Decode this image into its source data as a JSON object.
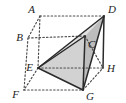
{
  "figure": {
    "width": 126,
    "height": 103,
    "background_color": "#ffffff",
    "label_color": "#1c1c1c",
    "hidden_edge_color": "#4a4a4a",
    "solid_edge_color": "#2a2a2a",
    "face_fill_light": "#e2e2e2",
    "face_fill_mid": "#d2d2d2",
    "face_fill_dark": "#bdbdbd",
    "vertices": [
      {
        "id": "A",
        "label": "A",
        "x": 40,
        "y": 16,
        "lx": 35,
        "ly": 10,
        "anchor": "end"
      },
      {
        "id": "B",
        "label": "B",
        "x": 28,
        "y": 38,
        "lx": 23,
        "ly": 38,
        "anchor": "end"
      },
      {
        "id": "C",
        "label": "C",
        "x": 85,
        "y": 36,
        "lx": 88,
        "ly": 45,
        "anchor": "start"
      },
      {
        "id": "D",
        "label": "D",
        "x": 104,
        "y": 16,
        "lx": 108,
        "ly": 10,
        "anchor": "start"
      },
      {
        "id": "E",
        "label": "E",
        "x": 38,
        "y": 68,
        "lx": 33,
        "ly": 68,
        "anchor": "end"
      },
      {
        "id": "F",
        "label": "F",
        "x": 24,
        "y": 90,
        "lx": 19,
        "ly": 95,
        "anchor": "end"
      },
      {
        "id": "G",
        "label": "G",
        "x": 83,
        "y": 90,
        "lx": 86,
        "ly": 97,
        "anchor": "start"
      },
      {
        "id": "H",
        "label": "H",
        "x": 103,
        "y": 68,
        "lx": 107,
        "ly": 69,
        "anchor": "start"
      }
    ],
    "hidden_edges": [
      {
        "name": "A-B",
        "from": "A",
        "to": "B"
      },
      {
        "name": "A-D",
        "from": "A",
        "to": "D"
      },
      {
        "name": "A-E",
        "from": "A",
        "to": "E"
      },
      {
        "name": "B-C",
        "from": "B",
        "to": "C"
      },
      {
        "name": "B-F",
        "from": "B",
        "to": "F"
      },
      {
        "name": "C-H",
        "from": "C",
        "to": "H"
      },
      {
        "name": "E-F",
        "from": "E",
        "to": "F"
      },
      {
        "name": "E-H",
        "from": "E",
        "to": "H"
      },
      {
        "name": "F-G",
        "from": "F",
        "to": "G"
      },
      {
        "name": "G-H",
        "from": "G",
        "to": "H"
      }
    ],
    "solid_edges": [
      {
        "name": "E-D",
        "from": "E",
        "to": "D"
      },
      {
        "name": "E-C",
        "from": "E",
        "to": "C"
      },
      {
        "name": "E-G",
        "from": "E",
        "to": "G"
      },
      {
        "name": "D-G",
        "from": "D",
        "to": "G"
      },
      {
        "name": "C-G",
        "from": "C",
        "to": "G"
      },
      {
        "name": "D-H",
        "from": "D",
        "to": "H"
      }
    ],
    "faces": [
      {
        "name": "face-E-C-D",
        "vertices": "E,C,D",
        "fill": "#e2e2e2"
      },
      {
        "name": "face-E-C-G",
        "vertices": "E,C,G",
        "fill": "#d2d2d2"
      },
      {
        "name": "face-C-D-G",
        "vertices": "C,D,G",
        "fill": "#bdbdbd"
      }
    ]
  }
}
